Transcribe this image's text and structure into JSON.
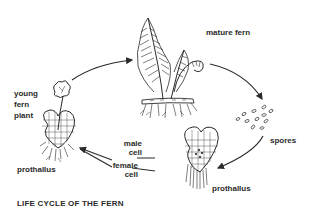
{
  "title": "LIFE CYCLE OF THE FERN",
  "stages": [
    {
      "id": "mature-fern",
      "label": "mature fern"
    },
    {
      "id": "spores",
      "label": "spores"
    },
    {
      "id": "prothallus-right",
      "label": "prothallus"
    },
    {
      "id": "male-cell",
      "label": "male cell"
    },
    {
      "id": "female-cell",
      "label": "female cell"
    },
    {
      "id": "young-fern-plant",
      "label": "young fern plant"
    },
    {
      "id": "prothallus-left",
      "label": "prothallus"
    }
  ],
  "labels": {
    "mature_fern": "mature fern",
    "spores": "spores",
    "prothallus_right": "prothallus",
    "male_line1": "male",
    "male_line2": "cell",
    "female_line1": "female",
    "female_line2": "cell",
    "young_line1": "young",
    "young_line2": "fern",
    "young_line3": "plant",
    "prothallus_left": "prothallus"
  },
  "cycle_order": [
    "mature fern",
    "spores",
    "prothallus",
    "male cell / female cell",
    "young fern plant",
    "mature fern"
  ],
  "colors": {
    "ink": "#2a2a2a",
    "background": "#ffffff"
  }
}
